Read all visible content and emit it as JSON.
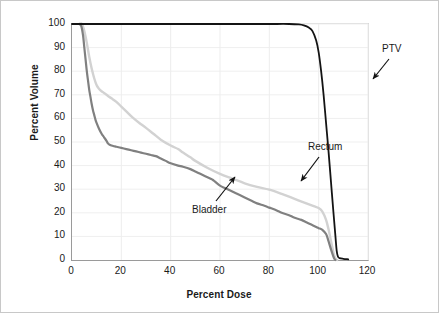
{
  "chart_data": {
    "type": "line",
    "title": "",
    "xlabel": "Percent Dose",
    "ylabel": "Percent Volume",
    "xlim": [
      0,
      120
    ],
    "ylim": [
      0,
      100
    ],
    "xticks": [
      0,
      20,
      40,
      60,
      80,
      100,
      120
    ],
    "yticks": [
      0,
      10,
      20,
      30,
      40,
      50,
      60,
      70,
      80,
      90,
      100
    ],
    "grid": true,
    "legend_position": "inline-annotations",
    "annotations": [
      {
        "label": "PTV",
        "color": "#1a1a1a",
        "points_to": [
          104,
          88
        ]
      },
      {
        "label": "Rectum",
        "color": "#1a1a1a",
        "points_to": [
          80,
          30
        ]
      },
      {
        "label": "Bladder",
        "color": "#1a1a1a",
        "points_to": [
          57,
          34
        ]
      }
    ],
    "series": [
      {
        "name": "PTV",
        "color": "#141414",
        "width": 1.8,
        "points": [
          [
            0,
            100
          ],
          [
            5,
            100
          ],
          [
            10,
            100
          ],
          [
            20,
            100
          ],
          [
            30,
            100
          ],
          [
            40,
            100
          ],
          [
            50,
            100
          ],
          [
            60,
            100
          ],
          [
            70,
            100
          ],
          [
            80,
            100
          ],
          [
            88,
            100
          ],
          [
            92,
            99.8
          ],
          [
            94,
            99.4
          ],
          [
            96,
            98.5
          ],
          [
            97.5,
            97
          ],
          [
            99,
            93
          ],
          [
            100,
            88
          ],
          [
            101,
            80
          ],
          [
            102,
            70
          ],
          [
            103,
            58
          ],
          [
            104,
            46
          ],
          [
            105,
            33
          ],
          [
            106,
            20
          ],
          [
            106.8,
            10
          ],
          [
            107.3,
            4
          ],
          [
            107.8,
            1.5
          ],
          [
            108.5,
            0.8
          ],
          [
            110,
            0.5
          ],
          [
            112,
            0.3
          ]
        ]
      },
      {
        "name": "Rectum",
        "color": "#d2d2d2",
        "width": 2.4,
        "points": [
          [
            3,
            100
          ],
          [
            4,
            100
          ],
          [
            5,
            97
          ],
          [
            6,
            92
          ],
          [
            7,
            86
          ],
          [
            8,
            81
          ],
          [
            9,
            77
          ],
          [
            10,
            74
          ],
          [
            11,
            72.5
          ],
          [
            12,
            71.5
          ],
          [
            13,
            70.8
          ],
          [
            14,
            70
          ],
          [
            15,
            69.2
          ],
          [
            16,
            68.5
          ],
          [
            18,
            67
          ],
          [
            20,
            65
          ],
          [
            22,
            63
          ],
          [
            25,
            60
          ],
          [
            28,
            57.5
          ],
          [
            30,
            56
          ],
          [
            33,
            53.5
          ],
          [
            36,
            51
          ],
          [
            40,
            48.5
          ],
          [
            43,
            47
          ],
          [
            45,
            45.5
          ],
          [
            48,
            43.5
          ],
          [
            50,
            42
          ],
          [
            55,
            39
          ],
          [
            60,
            36.5
          ],
          [
            65,
            34.5
          ],
          [
            70,
            32.5
          ],
          [
            75,
            31
          ],
          [
            80,
            29.8
          ],
          [
            85,
            28
          ],
          [
            90,
            26
          ],
          [
            95,
            24
          ],
          [
            98,
            22.8
          ],
          [
            100,
            22
          ],
          [
            101.5,
            20.5
          ],
          [
            103,
            17
          ],
          [
            104,
            13
          ],
          [
            105,
            8
          ],
          [
            105.8,
            4
          ],
          [
            106.4,
            1.5
          ],
          [
            107,
            0.3
          ],
          [
            107.5,
            0
          ]
        ]
      },
      {
        "name": "Bladder",
        "color": "#808080",
        "width": 2.2,
        "points": [
          [
            3,
            100
          ],
          [
            3.8,
            99
          ],
          [
            4.5,
            95
          ],
          [
            5,
            90
          ],
          [
            5.5,
            85
          ],
          [
            6,
            80
          ],
          [
            6.5,
            76
          ],
          [
            7,
            72
          ],
          [
            7.5,
            69
          ],
          [
            8,
            66
          ],
          [
            8.5,
            63.5
          ],
          [
            9,
            61.5
          ],
          [
            9.5,
            59.5
          ],
          [
            10,
            58
          ],
          [
            11,
            55.5
          ],
          [
            12,
            53.5
          ],
          [
            13,
            52
          ],
          [
            14,
            50.5
          ],
          [
            14.5,
            49.5
          ],
          [
            15,
            49
          ],
          [
            16,
            48.5
          ],
          [
            17,
            48.2
          ],
          [
            18,
            48
          ],
          [
            20,
            47.5
          ],
          [
            22,
            47
          ],
          [
            24,
            46.5
          ],
          [
            26,
            46
          ],
          [
            28,
            45.5
          ],
          [
            30,
            45
          ],
          [
            32,
            44.5
          ],
          [
            34,
            44
          ],
          [
            36,
            43
          ],
          [
            38,
            42
          ],
          [
            40,
            41
          ],
          [
            43,
            40
          ],
          [
            45,
            39.5
          ],
          [
            48,
            38.5
          ],
          [
            50,
            37.5
          ],
          [
            52,
            36.5
          ],
          [
            54,
            35.5
          ],
          [
            56,
            34.5
          ],
          [
            57,
            34
          ],
          [
            58,
            33.2
          ],
          [
            60,
            31.5
          ],
          [
            62,
            30.5
          ],
          [
            65,
            29
          ],
          [
            68,
            27.5
          ],
          [
            70,
            26.5
          ],
          [
            73,
            25
          ],
          [
            75,
            24
          ],
          [
            78,
            23
          ],
          [
            80,
            22.2
          ],
          [
            83,
            21
          ],
          [
            85,
            20
          ],
          [
            88,
            19
          ],
          [
            90,
            18
          ],
          [
            93,
            17
          ],
          [
            95,
            16
          ],
          [
            97,
            15
          ],
          [
            99,
            14
          ],
          [
            100,
            13.5
          ],
          [
            101.5,
            12.8
          ],
          [
            103,
            11
          ],
          [
            104,
            8
          ],
          [
            105,
            4.5
          ],
          [
            105.8,
            2
          ],
          [
            106.3,
            0.6
          ],
          [
            106.8,
            0
          ]
        ]
      }
    ]
  },
  "axes": {
    "y_tick_labels": [
      "100",
      "90",
      "80",
      "70",
      "60",
      "50",
      "40",
      "30",
      "20",
      "10",
      "0"
    ],
    "x_tick_labels": [
      "0",
      "20",
      "40",
      "60",
      "80",
      "100",
      "120"
    ],
    "y_title": "Percent Volume",
    "x_title": "Percent Dose"
  },
  "labels": {
    "ptv": "PTV",
    "rectum": "Rectum",
    "bladder": "Bladder"
  }
}
